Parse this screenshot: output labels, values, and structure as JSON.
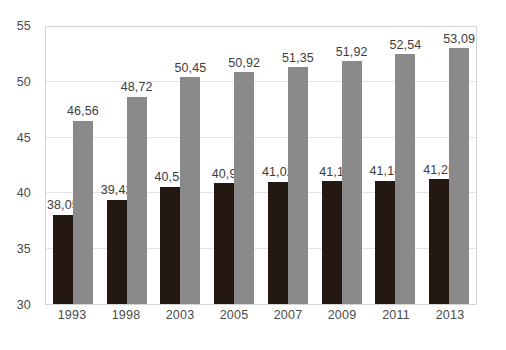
{
  "chart_data": {
    "type": "bar",
    "title": "",
    "subtitle": "",
    "xlabel": "",
    "ylabel": "",
    "ylim": [
      30,
      55
    ],
    "y_ticks": [
      "30",
      "35",
      "40",
      "45",
      "50",
      "55"
    ],
    "y_tick_values": [
      30,
      35,
      40,
      45,
      50,
      55
    ],
    "gridlines": [
      35,
      40,
      45,
      50
    ],
    "grid": true,
    "legend": "none",
    "decimal_separator": ",",
    "categories": [
      "1993",
      "1998",
      "2003",
      "2005",
      "2007",
      "2009",
      "2011",
      "2013"
    ],
    "series": [
      {
        "name": "dark-series",
        "color": "#241812",
        "values": [
          38.05,
          39.42,
          40.58,
          40.9,
          41.02,
          41.1,
          41.14,
          41.25
        ],
        "labels": [
          "38,05",
          "39,42",
          "40,58",
          "40,9",
          "41,02",
          "41,1",
          "41,14",
          "41,25"
        ]
      },
      {
        "name": "gray-series",
        "color": "#8a8a8a",
        "values": [
          46.56,
          48.72,
          50.45,
          50.92,
          51.35,
          51.92,
          52.54,
          53.09
        ],
        "labels": [
          "46,56",
          "48,72",
          "50,45",
          "50,92",
          "51,35",
          "51,92",
          "52,54",
          "53,09"
        ]
      }
    ],
    "colors": {
      "dark_bar": "#241812",
      "gray_bar": "#8a8a8a",
      "gridline": "#e3e3e3",
      "plot_border": "#d4d4d4",
      "tick_text": "#4a4a4a",
      "value_text": "#3d3d3d",
      "background": "#ffffff"
    }
  }
}
